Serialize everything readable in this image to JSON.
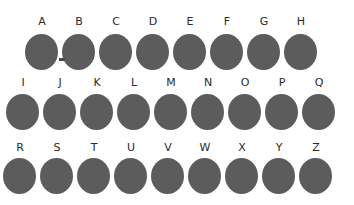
{
  "diagram": {
    "type": "letter-circle-grid",
    "circle_color": "#5c5c5c",
    "rows": [
      {
        "letters": [
          "A",
          "B",
          "C",
          "D",
          "E",
          "F",
          "G",
          "H"
        ]
      },
      {
        "letters": [
          "I",
          "J",
          "K",
          "L",
          "M",
          "N",
          "O",
          "P",
          "Q"
        ]
      },
      {
        "letters": [
          "R",
          "S",
          "T",
          "U",
          "V",
          "W",
          "X",
          "Y",
          "Z"
        ]
      }
    ]
  }
}
